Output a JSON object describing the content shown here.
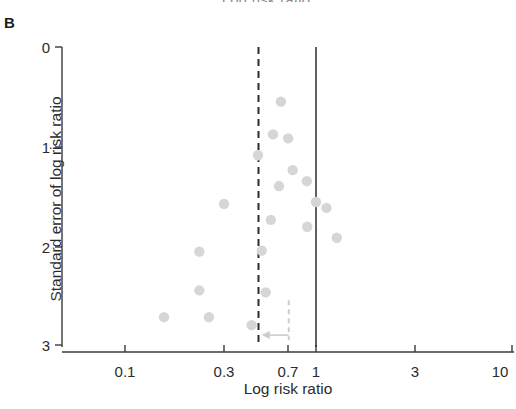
{
  "figure": {
    "panel_label": "B",
    "clipped_title_above": "Log risk ratio",
    "xlabel": "Log risk ratio",
    "ylabel": "Standard error of log risk ratio",
    "dot_color": "#d6d6d6",
    "axis_color": "#3a3a3a",
    "reference_line_color": "#2d2d2d",
    "adjust_line_color": "#cccccc"
  },
  "axes": {
    "x_ticks": [
      "0.1",
      "0.3",
      "0.7",
      "1",
      "3",
      "10"
    ],
    "y_ticks": [
      "0",
      "1",
      "2",
      "3"
    ],
    "x_scale": "log",
    "x_range": [
      "0.07",
      "10"
    ],
    "y_range": [
      "0",
      "3"
    ],
    "grid": "off",
    "legend": "none"
  },
  "annotations": {
    "solid_vertical_line_at": "1",
    "dashed_vertical_line_at": "0.5",
    "arrow_direction": "left",
    "arrow_label": ""
  },
  "chart_data": {
    "type": "scatter",
    "title": "",
    "subtitle": "",
    "xlabel": "Log risk ratio",
    "ylabel": "Standard error of log risk ratio",
    "xscale": "log",
    "xlim": [
      0.07,
      10
    ],
    "ylim": [
      0,
      3
    ],
    "y_inverted": true,
    "grid": false,
    "legend": null,
    "x_tick_values": [
      0.1,
      0.3,
      0.7,
      1,
      3,
      10
    ],
    "y_tick_values": [
      0,
      1,
      2,
      3
    ],
    "reference_lines": [
      {
        "name": "null-effect-line",
        "x": 1.0,
        "style": "solid",
        "color": "#2d2d2d"
      },
      {
        "name": "pooled-estimate-line",
        "x": 0.5,
        "style": "dashed",
        "color": "#2d2d2d"
      },
      {
        "name": "adjusted-estimate-line",
        "x": 0.72,
        "style": "dashed",
        "color": "#cccccc",
        "y_from": 2.55,
        "y_to": 2.95
      }
    ],
    "arrows": [
      {
        "name": "adjustment-arrow",
        "x_from": 0.72,
        "x_to": 0.52,
        "y": 2.9,
        "direction": "left",
        "color": "#cccccc"
      }
    ],
    "points": [
      {
        "x": 0.655,
        "y": 0.55
      },
      {
        "x": 0.595,
        "y": 0.88
      },
      {
        "x": 0.715,
        "y": 0.92
      },
      {
        "x": 0.497,
        "y": 1.09
      },
      {
        "x": 0.755,
        "y": 1.24
      },
      {
        "x": 0.64,
        "y": 1.4
      },
      {
        "x": 0.895,
        "y": 1.35
      },
      {
        "x": 1.0,
        "y": 1.56
      },
      {
        "x": 0.33,
        "y": 1.58
      },
      {
        "x": 0.58,
        "y": 1.74
      },
      {
        "x": 1.135,
        "y": 1.62
      },
      {
        "x": 0.9,
        "y": 1.81
      },
      {
        "x": 1.285,
        "y": 1.92
      },
      {
        "x": 0.52,
        "y": 2.05
      },
      {
        "x": 0.245,
        "y": 2.06
      },
      {
        "x": 0.245,
        "y": 2.45
      },
      {
        "x": 0.545,
        "y": 2.47
      },
      {
        "x": 0.16,
        "y": 2.72
      },
      {
        "x": 0.275,
        "y": 2.72
      },
      {
        "x": 0.46,
        "y": 2.8
      }
    ]
  }
}
